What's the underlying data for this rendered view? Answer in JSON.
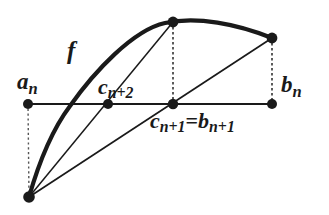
{
  "figure": {
    "type": "mathematical-diagram",
    "width": 329,
    "height": 215,
    "background_color": "#ffffff",
    "ink_color": "#1a1a1a"
  },
  "labels": {
    "f": "f",
    "a_n": {
      "base": "a",
      "sub": "n"
    },
    "b_n": {
      "base": "b",
      "sub": "n"
    },
    "c_n_plus_2": {
      "base": "c",
      "sub": "n+2"
    },
    "c_n_plus_1_eq_b_n_plus_1": {
      "left_base": "c",
      "left_sub": "n+1",
      "equals": "=",
      "right_base": "b",
      "right_sub": "n+1"
    }
  },
  "geometry": {
    "axis": {
      "y": 104,
      "x_start": 28,
      "x_end": 272
    },
    "points": [
      {
        "name": "a_n",
        "x": 28,
        "y": 104,
        "on": "axis"
      },
      {
        "name": "c_n_plus_2",
        "x": 108,
        "y": 104,
        "on": "axis"
      },
      {
        "name": "c_n_plus_1",
        "x": 173,
        "y": 104,
        "on": "axis"
      },
      {
        "name": "b_n",
        "x": 272,
        "y": 104,
        "on": "axis"
      },
      {
        "name": "curve_peak",
        "x": 173,
        "y": 22,
        "on": "curve"
      },
      {
        "name": "curve_right_end",
        "x": 272,
        "y": 38,
        "on": "curve"
      },
      {
        "name": "curve_bottom_left",
        "x": 29,
        "y": 197,
        "on": "curve"
      }
    ],
    "curve": {
      "stroke_width": 4,
      "path": "M 29 197 C 40 160 52 128 70 104 C 95 68 132 30 164 23 C 196 16 236 24 272 38"
    },
    "chords": [
      {
        "from": "curve_bottom_left",
        "to": "curve_peak",
        "stroke_width": 1.4
      },
      {
        "from": "curve_bottom_left",
        "to": "curve_right_end",
        "stroke_width": 1.6
      }
    ],
    "dotted_verticals": [
      {
        "x": 28,
        "y_top": 104,
        "y_bottom": 197
      },
      {
        "x": 173,
        "y_top": 22,
        "y_bottom": 104
      },
      {
        "x": 272,
        "y_top": 38,
        "y_bottom": 104
      }
    ],
    "dot_radius": 5
  }
}
